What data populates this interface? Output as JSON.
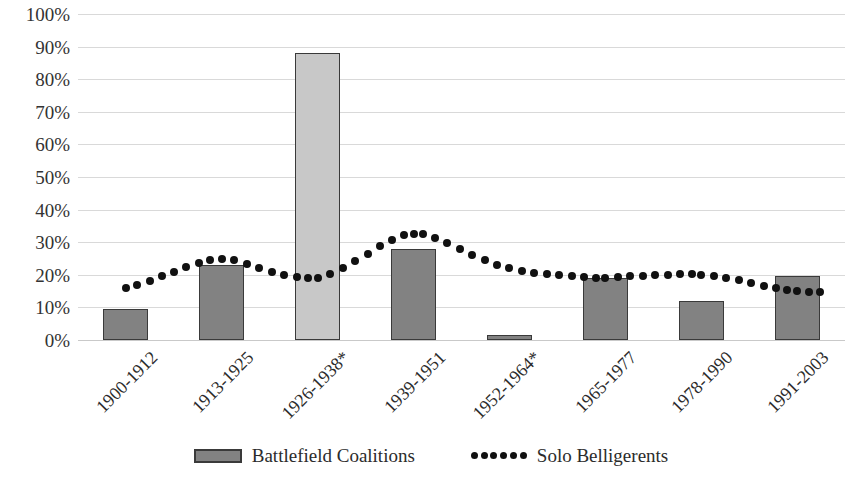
{
  "chart_data": {
    "type": "bar",
    "title": "",
    "subtitle": "",
    "xlabel": "",
    "ylabel": "",
    "categories": [
      "1900-1912",
      "1913-1925",
      "1926-1938*",
      "1939-1951",
      "1952-1964*",
      "1965-1977",
      "1978-1990",
      "1991-2003"
    ],
    "ylim": [
      0,
      100
    ],
    "ytick_labels": [
      "100%",
      "90%",
      "80%",
      "70%",
      "60%",
      "50%",
      "40%",
      "30%",
      "20%",
      "10%",
      "0%"
    ],
    "ytick_values": [
      100,
      90,
      80,
      70,
      60,
      50,
      40,
      30,
      20,
      10,
      0
    ],
    "grid": "horizontal",
    "legend_position": "bottom-center",
    "series": [
      {
        "name": "Battlefield Coalitions",
        "type": "bar",
        "color": "#828282",
        "highlight_color": "#c8c8c8",
        "values": [
          9.5,
          23,
          88,
          28,
          1.5,
          19,
          12,
          19.5
        ],
        "highlighted_categories": [
          "1926-1938*"
        ]
      },
      {
        "name": "Solo Belligerents",
        "type": "line",
        "style": "dotted",
        "color": "#111111",
        "values": [
          16,
          25,
          19,
          32,
          22,
          19,
          20,
          15
        ],
        "dense_points": [
          {
            "x": 0.0,
            "y": 16.0
          },
          {
            "x": 0.12,
            "y": 17.0
          },
          {
            "x": 0.25,
            "y": 18.2
          },
          {
            "x": 0.38,
            "y": 19.6
          },
          {
            "x": 0.5,
            "y": 21.0
          },
          {
            "x": 0.63,
            "y": 22.4
          },
          {
            "x": 0.76,
            "y": 23.6
          },
          {
            "x": 0.88,
            "y": 24.6
          },
          {
            "x": 1.0,
            "y": 25.0
          },
          {
            "x": 1.13,
            "y": 24.4
          },
          {
            "x": 1.26,
            "y": 23.4
          },
          {
            "x": 1.39,
            "y": 22.2
          },
          {
            "x": 1.52,
            "y": 21.0
          },
          {
            "x": 1.65,
            "y": 20.0
          },
          {
            "x": 1.78,
            "y": 19.4
          },
          {
            "x": 1.9,
            "y": 19.0
          },
          {
            "x": 2.0,
            "y": 19.0
          },
          {
            "x": 2.13,
            "y": 20.2
          },
          {
            "x": 2.26,
            "y": 22.0
          },
          {
            "x": 2.39,
            "y": 24.2
          },
          {
            "x": 2.52,
            "y": 26.5
          },
          {
            "x": 2.65,
            "y": 28.8
          },
          {
            "x": 2.78,
            "y": 30.8
          },
          {
            "x": 2.9,
            "y": 32.2
          },
          {
            "x": 3.0,
            "y": 32.6
          },
          {
            "x": 3.1,
            "y": 32.4
          },
          {
            "x": 3.22,
            "y": 31.4
          },
          {
            "x": 3.35,
            "y": 29.8
          },
          {
            "x": 3.48,
            "y": 28.0
          },
          {
            "x": 3.61,
            "y": 26.2
          },
          {
            "x": 3.74,
            "y": 24.4
          },
          {
            "x": 3.87,
            "y": 23.0
          },
          {
            "x": 4.0,
            "y": 22.0
          },
          {
            "x": 4.13,
            "y": 21.3
          },
          {
            "x": 4.26,
            "y": 20.7
          },
          {
            "x": 4.39,
            "y": 20.2
          },
          {
            "x": 4.52,
            "y": 19.8
          },
          {
            "x": 4.65,
            "y": 19.5
          },
          {
            "x": 4.78,
            "y": 19.2
          },
          {
            "x": 4.9,
            "y": 19.0
          },
          {
            "x": 5.0,
            "y": 19.0
          },
          {
            "x": 5.13,
            "y": 19.2
          },
          {
            "x": 5.26,
            "y": 19.5
          },
          {
            "x": 5.39,
            "y": 19.7
          },
          {
            "x": 5.52,
            "y": 19.9
          },
          {
            "x": 5.65,
            "y": 20.0
          },
          {
            "x": 5.78,
            "y": 20.1
          },
          {
            "x": 5.9,
            "y": 20.1
          },
          {
            "x": 6.0,
            "y": 20.0
          },
          {
            "x": 6.13,
            "y": 19.6
          },
          {
            "x": 6.26,
            "y": 19.0
          },
          {
            "x": 6.39,
            "y": 18.3
          },
          {
            "x": 6.52,
            "y": 17.5
          },
          {
            "x": 6.65,
            "y": 16.7
          },
          {
            "x": 6.78,
            "y": 16.0
          },
          {
            "x": 6.9,
            "y": 15.4
          },
          {
            "x": 7.0,
            "y": 15.0
          },
          {
            "x": 7.12,
            "y": 14.8
          },
          {
            "x": 7.24,
            "y": 14.7
          }
        ]
      }
    ]
  },
  "legend": {
    "items": [
      {
        "label": "Battlefield Coalitions",
        "marker": "bar-swatch"
      },
      {
        "label": "Solo Belligerents",
        "marker": "dotted-line"
      }
    ]
  }
}
